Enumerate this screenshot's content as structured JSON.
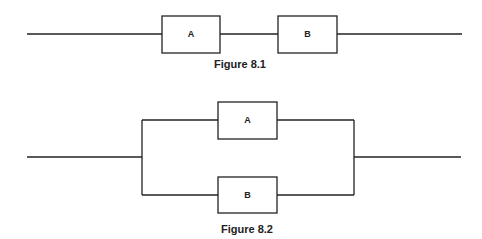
{
  "figures": [
    {
      "caption": "Figure 8.1",
      "type": "series",
      "blocks": [
        {
          "label": "A"
        },
        {
          "label": "B"
        }
      ]
    },
    {
      "caption": "Figure 8.2",
      "type": "parallel",
      "blocks": [
        {
          "label": "A"
        },
        {
          "label": "B"
        }
      ]
    }
  ]
}
